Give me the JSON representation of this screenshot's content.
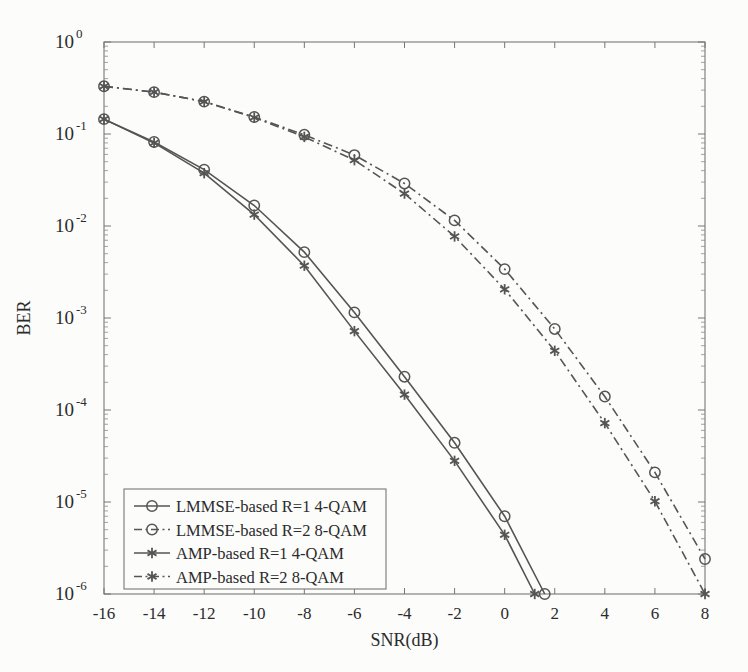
{
  "chart_data": {
    "type": "line",
    "title": "",
    "xlabel": "SNR(dB)",
    "ylabel": "BER",
    "xlim": [
      -16,
      8
    ],
    "ylim": [
      1e-06,
      1
    ],
    "yscale": "log",
    "xticks": [
      -16,
      -14,
      -12,
      -10,
      -8,
      -6,
      -4,
      -2,
      0,
      2,
      4,
      6,
      8
    ],
    "xtick_labels": [
      "-16",
      "-14",
      "-12",
      "-10",
      "-8",
      "-6",
      "-4",
      "-2",
      "0",
      "2",
      "4",
      "6",
      "8"
    ],
    "yticks": [
      1,
      0.1,
      0.01,
      0.001,
      0.0001,
      1e-05,
      1e-06
    ],
    "ytick_labels": [
      "10",
      "10",
      "10",
      "10",
      "10",
      "10",
      "10"
    ],
    "ytick_exponents": [
      "0",
      "-1",
      "-2",
      "-3",
      "-4",
      "-5",
      "-6"
    ],
    "grid": false,
    "legend_position": "lower-left-inside",
    "line_color": "#555555",
    "series": [
      {
        "name": "LMMSE-based R=1 4-QAM",
        "marker": "circle",
        "linestyle": "solid",
        "x": [
          -16,
          -14,
          -12,
          -10,
          -8,
          -6,
          -4,
          -2,
          0,
          1.6
        ],
        "y": [
          0.145,
          0.082,
          0.041,
          0.0167,
          0.0052,
          0.00115,
          0.00023,
          4.4e-05,
          7e-06,
          1e-06
        ]
      },
      {
        "name": "LMMSE-based R=2 8-QAM",
        "marker": "circle",
        "linestyle": "dashdot",
        "x": [
          -16,
          -14,
          -12,
          -10,
          -8,
          -6,
          -4,
          -2,
          0,
          2,
          4,
          6,
          8
        ],
        "y": [
          0.33,
          0.285,
          0.225,
          0.153,
          0.098,
          0.059,
          0.029,
          0.0115,
          0.0034,
          0.00076,
          0.00014,
          2.1e-05,
          2.4e-06
        ]
      },
      {
        "name": "AMP-based  R=1 4-QAM",
        "marker": "star",
        "linestyle": "solid",
        "x": [
          -16,
          -14,
          -12,
          -10,
          -8,
          -6,
          -4,
          -2,
          0,
          1.2
        ],
        "y": [
          0.145,
          0.08,
          0.0375,
          0.0133,
          0.0037,
          0.00072,
          0.000147,
          2.8e-05,
          4.4e-06,
          1e-06
        ]
      },
      {
        "name": "AMP-based  R=2 8-QAM",
        "marker": "star",
        "linestyle": "dashdot",
        "x": [
          -16,
          -14,
          -12,
          -10,
          -8,
          -6,
          -4,
          -2,
          0,
          2,
          4,
          6,
          8
        ],
        "y": [
          0.33,
          0.285,
          0.225,
          0.151,
          0.093,
          0.052,
          0.0225,
          0.0077,
          0.00205,
          0.00044,
          7.2e-05,
          1.02e-05,
          1e-06
        ]
      }
    ],
    "legend_entries": [
      {
        "label": "LMMSE-based R=1 4-QAM",
        "marker": "circle",
        "linestyle": "solid"
      },
      {
        "label": "LMMSE-based R=2 8-QAM",
        "marker": "circle",
        "linestyle": "dashdot"
      },
      {
        "label": "AMP-based  R=1 4-QAM",
        "marker": "star",
        "linestyle": "solid"
      },
      {
        "label": "AMP-based  R=2 8-QAM",
        "marker": "star",
        "linestyle": "dashdot"
      }
    ]
  }
}
